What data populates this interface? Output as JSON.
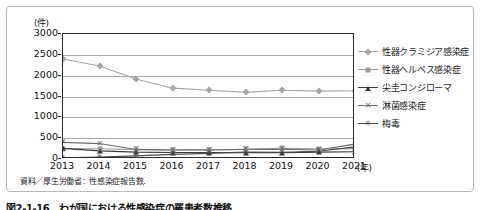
{
  "chart_data": {
    "type": "line",
    "title": "",
    "xlabel": "(年)",
    "ylabel": "(件)",
    "x": [
      2013,
      2014,
      2015,
      2016,
      2017,
      2018,
      2019,
      2020,
      2021
    ],
    "categories": [
      "2013",
      "2014",
      "2015",
      "2016",
      "2017",
      "2018",
      "2019",
      "2020",
      "2021"
    ],
    "ylim": [
      0,
      3000
    ],
    "yticks": [
      0,
      500,
      1000,
      1500,
      2000,
      2500,
      3000
    ],
    "ytick_labels": [
      "0",
      "500",
      "1000",
      "1500",
      "2000",
      "2500",
      "3000"
    ],
    "grid": true,
    "legend_position": "right",
    "series": [
      {
        "name": "性器クラミジア感染症",
        "marker": "diamond",
        "color": "#a6a6a6",
        "values": [
          2400,
          2230,
          1920,
          1700,
          1650,
          1600,
          1650,
          1630,
          1640
        ]
      },
      {
        "name": "性器ヘルペス感染症",
        "marker": "square",
        "color": "#9e9e9e",
        "values": [
          250,
          245,
          225,
          220,
          225,
          230,
          255,
          245,
          250
        ]
      },
      {
        "name": "尖圭コンジローマ",
        "marker": "triangle",
        "color": "#3a3a3a",
        "values": [
          255,
          195,
          165,
          155,
          155,
          150,
          150,
          165,
          175
        ]
      },
      {
        "name": "淋菌感染症",
        "marker": "x",
        "color": "#6e6e6e",
        "values": [
          400,
          370,
          230,
          215,
          215,
          230,
          235,
          215,
          360
        ]
      },
      {
        "name": "梅毒",
        "marker": "star",
        "color": "#4a4a4a",
        "values": [
          30,
          45,
          75,
          110,
          135,
          165,
          160,
          185,
          290
        ]
      }
    ]
  },
  "axis": {
    "y_unit": "(件)",
    "x_unit": "(年)"
  },
  "source_note": "資料／厚生労働省：性感染症報告数.",
  "caption": "図2-1-16　わが国における性感染症の罹患者数推移"
}
